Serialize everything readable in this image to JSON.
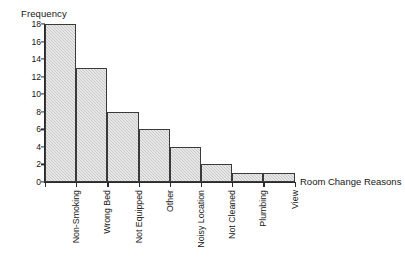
{
  "chart_data": {
    "type": "bar",
    "title": "",
    "xlabel": "Room Change Reasons",
    "ylabel": "Frequency",
    "categories": [
      "Non-Smoking",
      "Wrong Bed",
      "Not Equipped",
      "Other",
      "Noisy Location",
      "Not Cleaned",
      "Plumbing",
      "View"
    ],
    "values": [
      18,
      13,
      8,
      6,
      4,
      2,
      1,
      1
    ],
    "ylim": [
      0,
      18
    ],
    "ytick_labels": [
      "0",
      "2",
      "4",
      "6",
      "8",
      "10",
      "12",
      "14",
      "16",
      "18"
    ],
    "ytick_values": [
      0,
      2,
      4,
      6,
      8,
      10,
      12,
      14,
      16,
      18
    ],
    "grid": false,
    "legend": false,
    "bar_fill_color": "#c9c9c9",
    "bar_border_color": "#3a3a3a",
    "axis_color": "#2b2b2b",
    "background_color": "#ffffff"
  }
}
